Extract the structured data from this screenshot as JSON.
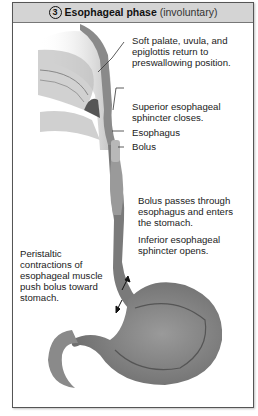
{
  "header": {
    "step_number": "3",
    "title": "Esophageal phase",
    "subtitle": "(involuntary)"
  },
  "labels": {
    "soft_palate": [
      "Soft palate, uvula, and",
      "epiglottis return to",
      "preswallowing position."
    ],
    "superior_sphincter": [
      "Superior esophageal",
      "sphincter closes."
    ],
    "esophagus": "Esophagus",
    "bolus": "Bolus",
    "bolus_passes": [
      "Bolus passes through",
      "esophagus and enters",
      "the stomach."
    ],
    "inferior_sphincter": [
      "Inferior esophageal",
      "sphincter opens."
    ],
    "peristaltic": [
      "Peristaltic",
      "contractions of",
      "esophageal muscle",
      "push bolus toward",
      "stomach."
    ]
  },
  "colors": {
    "header_bg": "#d4d4d4",
    "border": "#555555",
    "tissue_dark": "#6b6b6b",
    "tissue_light": "#a8a8a8"
  }
}
